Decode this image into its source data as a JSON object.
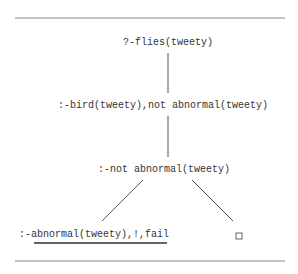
{
  "diagram": {
    "type": "sld-resolution-tree",
    "nodes": [
      {
        "id": "root",
        "label": "?-flies(tweety)"
      },
      {
        "id": "n1",
        "label": ":-bird(tweety),not abnormal(tweety)"
      },
      {
        "id": "n2",
        "label": ":-not abnormal(tweety)"
      },
      {
        "id": "n3",
        "label": ":-abnormal(tweety),!,fail",
        "underlined_part": "abnormal(tweety),!,fail"
      },
      {
        "id": "n4",
        "label": "",
        "symbol": "empty-clause-box"
      }
    ],
    "edges": [
      {
        "from": "root",
        "to": "n1"
      },
      {
        "from": "n1",
        "to": "n2"
      },
      {
        "from": "n2",
        "to": "n3"
      },
      {
        "from": "n2",
        "to": "n4"
      }
    ]
  }
}
